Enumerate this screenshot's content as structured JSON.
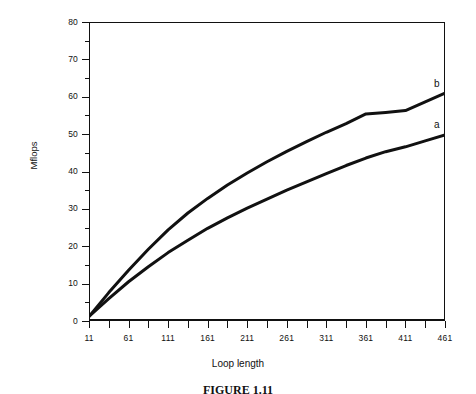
{
  "chart_data": {
    "type": "line",
    "title": "",
    "xlabel": "Loop length",
    "ylabel": "Mflops",
    "xlim": [
      11,
      461
    ],
    "ylim": [
      0,
      80
    ],
    "grid": false,
    "legend_position": "inline-right-end",
    "x_tick_labels": [
      "11",
      "61",
      "111",
      "161",
      "211",
      "261",
      "311",
      "361",
      "411",
      "461"
    ],
    "x_tick_values": [
      11,
      61,
      111,
      161,
      211,
      261,
      311,
      361,
      411,
      461
    ],
    "x_minor_tick_values": [
      36,
      86,
      136,
      186,
      236,
      286,
      336,
      386,
      436
    ],
    "y_tick_labels": [
      "0",
      "10",
      "20",
      "30",
      "40",
      "50",
      "60",
      "70",
      "80"
    ],
    "y_tick_values": [
      0,
      10,
      20,
      30,
      40,
      50,
      60,
      70,
      80
    ],
    "y_minor_tick_values": [
      5,
      15,
      25,
      35,
      45,
      55,
      65,
      75
    ],
    "x": [
      11,
      36,
      61,
      86,
      111,
      136,
      161,
      186,
      211,
      236,
      261,
      286,
      311,
      336,
      361,
      386,
      411,
      436,
      461
    ],
    "series": [
      {
        "name": "a",
        "label": "a",
        "color": "#111111",
        "values": [
          1.2,
          6.0,
          10.5,
          14.5,
          18.3,
          21.6,
          24.8,
          27.6,
          30.2,
          32.6,
          35.0,
          37.2,
          39.4,
          41.6,
          43.6,
          45.3,
          46.6,
          48.2,
          49.8
        ]
      },
      {
        "name": "b",
        "label": "b",
        "color": "#111111",
        "values": [
          1.2,
          7.6,
          13.6,
          19.2,
          24.4,
          28.9,
          32.8,
          36.4,
          39.6,
          42.6,
          45.4,
          48.0,
          50.5,
          52.8,
          55.4,
          55.8,
          56.3,
          58.6,
          61.0
        ]
      }
    ],
    "annotations": [
      {
        "text": "a",
        "x": 461,
        "y": 52.5
      },
      {
        "text": "b",
        "x": 461,
        "y": 63.5
      }
    ]
  },
  "axes": {
    "y_title": "Mflops",
    "x_title": "Loop length"
  },
  "caption": {
    "text": "FIGURE 1.11"
  },
  "colors": {
    "line": "#111111",
    "axis": "#111111",
    "background": "#ffffff"
  }
}
